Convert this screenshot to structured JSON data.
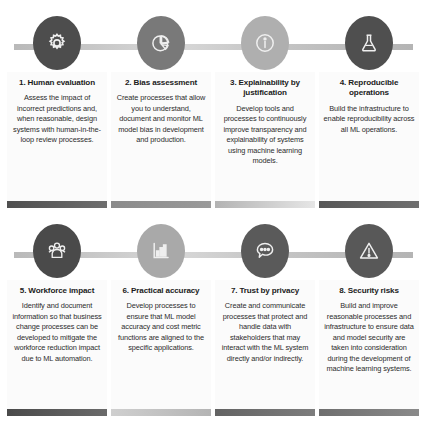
{
  "document": {
    "cut_off_header": " "
  },
  "colors": {
    "circle_dark": "#4d4d4d",
    "circle_mid": "#6e6e6e",
    "circle_light": "#a8a8a8",
    "circle_light2": "#b0b0b0",
    "connector_gray": "#c4c4c4",
    "bar_dark": "#5e5e5e",
    "bar_light": "#c2c2c2",
    "panel_bg": "#fbfbfb",
    "text": "#2b2b2b",
    "title_text": "#1c1c1c"
  },
  "rows": [
    {
      "name": "row-top",
      "cards": [
        {
          "number": "1.",
          "title": "1. Human evaluation",
          "text": "Assess the impact of incorrect predictions and, when reasonable, design systems with human-in-the-loop review processes.",
          "icon": "gear-icon",
          "circle_color": "#4d4d4d",
          "bar_color": "#5b5b5b"
        },
        {
          "number": "2.",
          "title": "2. Bias assessment",
          "text": "Create processes that allow you to understand, document and monitor ML model bias in development and production.",
          "icon": "pie-chart-icon",
          "circle_color": "#797979",
          "bar_color": "#8e8e8e"
        },
        {
          "number": "3.",
          "title": "3. Explainability by justification",
          "text": "Develop tools and processes to continuously improve transparency and explainability of systems using machine learning models.",
          "icon": "info-icon",
          "circle_color": "#afafaf",
          "bar_color": "#bdbdbd"
        },
        {
          "number": "4.",
          "title": "4. Reproducible operations",
          "text": "Build the infrastructure to enable reproducibility across all ML operations.",
          "icon": "flask-icon",
          "circle_color": "#4f4f4f",
          "bar_color": "#5e5e5e"
        }
      ]
    },
    {
      "name": "row-bottom",
      "cards": [
        {
          "number": "5.",
          "title": "5. Workforce impact",
          "text": "Identify and document information so that business change processes can be developed to mitigate the workforce reduction impact due to ML automation.",
          "icon": "people-group-icon",
          "circle_color": "#4a4a4a",
          "bar_color": "#565656"
        },
        {
          "number": "6.",
          "title": "6. Practical accuracy",
          "text": "Develop processes to ensure that ML model accuracy and cost metric functions are aligned to the specific applications.",
          "icon": "bar-chart-icon",
          "circle_color": "#a9a9a9",
          "bar_color": "#c6c6c6"
        },
        {
          "number": "7.",
          "title": "7. Trust by privacy",
          "text": "Create and communicate processes that protect and handle data with stakeholders that may interact with the ML system directly and/or indirectly.",
          "icon": "speech-bubble-icon",
          "circle_color": "#5a5a5a",
          "bar_color": "#6a6a6a"
        },
        {
          "number": "8.",
          "title": "8. Security risks",
          "text": "Build and improve reasonable processes and infrastructure to ensure data and model security are taken into consideration during the development of machine learning systems.",
          "icon": "warning-triangle-icon",
          "circle_color": "#585858",
          "bar_color": "#6b6b6b"
        }
      ]
    }
  ]
}
